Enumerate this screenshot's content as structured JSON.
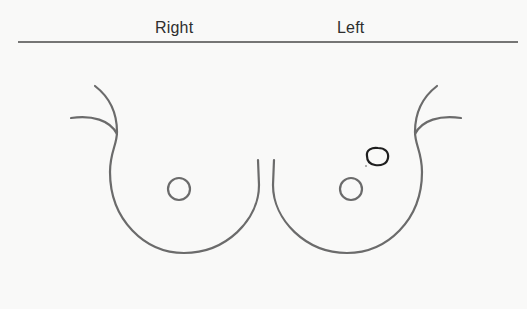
{
  "diagram": {
    "type": "breast-examination-chart",
    "labels": {
      "right": "Right",
      "left": "Left"
    },
    "colors": {
      "background": "#f9f9f8",
      "outline": "#6b6b6b",
      "rule": "#4a4a4a",
      "lesion": "#1f1f1f",
      "text": "#2e2e2e"
    },
    "breasts": [
      {
        "side": "Right",
        "nipple": {
          "cx": 179,
          "cy": 189,
          "r": 11
        }
      },
      {
        "side": "Left",
        "nipple": {
          "cx": 351,
          "cy": 189,
          "r": 11
        },
        "marked_lesion": {
          "cx": 377,
          "cy": 157,
          "rx": 11,
          "ry": 8,
          "location": "upper outer quadrant"
        }
      }
    ]
  }
}
